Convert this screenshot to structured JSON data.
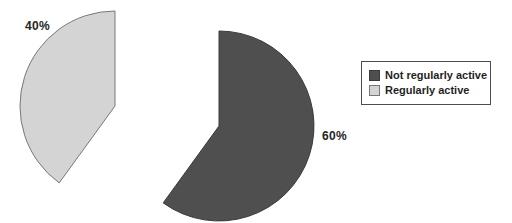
{
  "chart_data": {
    "type": "pie",
    "title": "",
    "slices": [
      {
        "name": "Not regularly active",
        "value": 60,
        "label": "60%",
        "color": "#4f4f4f",
        "stroke": "#3a3a3a"
      },
      {
        "name": "Regularly active",
        "value": 40,
        "label": "40%",
        "color": "#d4d4d4",
        "stroke": "#787878"
      }
    ],
    "start_angle_deg": 90,
    "direction": "clockwise",
    "exploded_slice": "Regularly active",
    "legend": {
      "position": "right",
      "border": "#4d4d4d",
      "entries": [
        "Not regularly active",
        "Regularly active"
      ]
    },
    "layout": {
      "base_center": [
        219,
        126
      ],
      "radius": 95,
      "explode_offset": [
        -104,
        -20
      ]
    }
  }
}
